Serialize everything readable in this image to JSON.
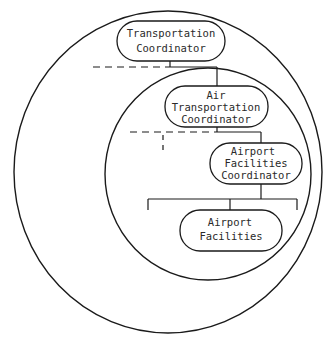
{
  "diagram": {
    "type": "nested-organization-chart",
    "colors": {
      "line": "#1a1a1a",
      "text": "#2a2a2a",
      "background": "#ffffff"
    },
    "nodes": [
      {
        "id": "transportation-coordinator",
        "lines": [
          "Transportation",
          "Coordinator"
        ]
      },
      {
        "id": "air-transportation-coordinator",
        "lines": [
          "Air",
          "Transportation",
          "Coordinator"
        ]
      },
      {
        "id": "airport-facilities-coordinator",
        "lines": [
          "Airport",
          "Facilities",
          "Coordinator"
        ]
      },
      {
        "id": "airport-facilities",
        "lines": [
          "Airport",
          "Facilities"
        ]
      }
    ],
    "edges": [
      {
        "from": "transportation-coordinator",
        "to": "air-transportation-coordinator",
        "style": "solid"
      },
      {
        "from": "air-transportation-coordinator",
        "to": "airport-facilities-coordinator",
        "style": "solid"
      },
      {
        "from": "airport-facilities-coordinator",
        "to": "airport-facilities",
        "style": "solid"
      }
    ],
    "containers": [
      {
        "id": "outer-circle",
        "contains": [
          "transportation-coordinator",
          "air-transportation-coordinator",
          "airport-facilities-coordinator",
          "airport-facilities"
        ]
      },
      {
        "id": "inner-circle",
        "contains": [
          "air-transportation-coordinator",
          "airport-facilities-coordinator",
          "airport-facilities"
        ]
      }
    ]
  }
}
